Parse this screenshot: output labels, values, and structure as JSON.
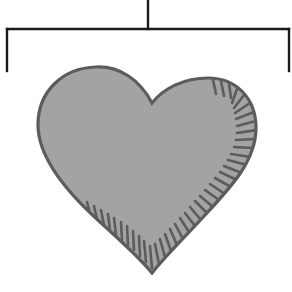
{
  "diagram": {
    "type": "tree-connector-with-heart",
    "connector": {
      "stroke_color": "#1a1a1a",
      "stroke_width": 2.4,
      "stem": {
        "x": 148,
        "y1": 0,
        "y2": 29
      },
      "bar": {
        "y": 29,
        "x1": 7,
        "x2": 289
      },
      "left_drop": {
        "x": 7,
        "y1": 29,
        "y2": 71
      },
      "right_drop": {
        "x": 289,
        "y1": 29,
        "y2": 71
      }
    },
    "heart": {
      "icon": "heart-icon",
      "fill_color": "#a3a3a3",
      "outline_color": "#5c5c5c",
      "hatch_color": "#5c5c5c",
      "tip": {
        "x": 152,
        "y": 273
      },
      "notch": {
        "x": 152,
        "y": 103
      }
    }
  }
}
